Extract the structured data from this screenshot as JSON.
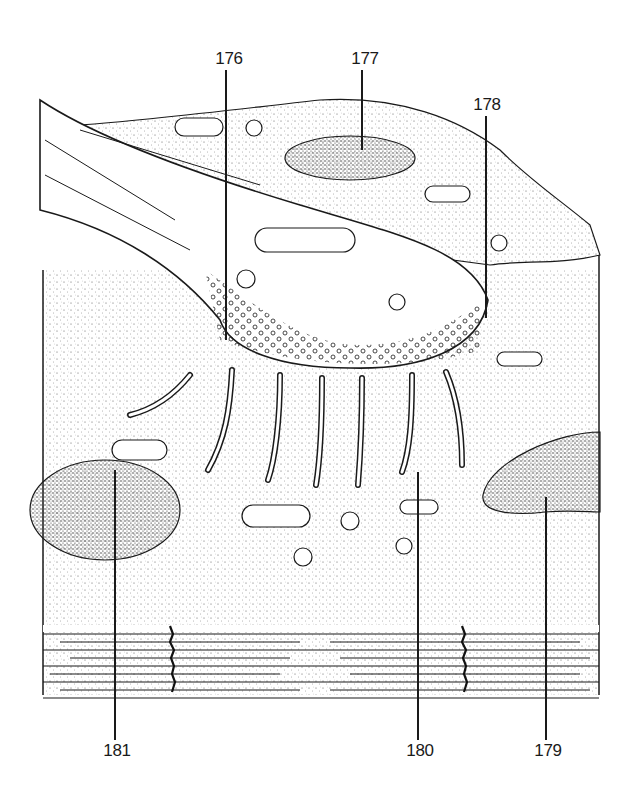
{
  "figure": {
    "type": "histology-line-drawing",
    "colors": {
      "ink": "#1a1a1a",
      "background": "#ffffff",
      "stipple": "#555555"
    }
  },
  "labels": [
    {
      "id": "176",
      "text": "176",
      "x": 229,
      "y": 66,
      "line_x": 226,
      "line_from": 70,
      "line_to": 340,
      "position": "top"
    },
    {
      "id": "177",
      "text": "177",
      "x": 365,
      "y": 66,
      "line_x": 362,
      "line_from": 70,
      "line_to": 150,
      "position": "top"
    },
    {
      "id": "178",
      "text": "178",
      "x": 487,
      "y": 112,
      "line_x": 486,
      "line_from": 116,
      "line_to": 318,
      "position": "top"
    },
    {
      "id": "179",
      "text": "179",
      "x": 548,
      "y": 758,
      "line_x": 546,
      "line_from": 497,
      "line_to": 740,
      "position": "bottom"
    },
    {
      "id": "180",
      "text": "180",
      "x": 420,
      "y": 758,
      "line_x": 418,
      "line_from": 472,
      "line_to": 740,
      "position": "bottom"
    },
    {
      "id": "181",
      "text": "181",
      "x": 117,
      "y": 758,
      "line_x": 115,
      "line_from": 470,
      "line_to": 740,
      "position": "bottom"
    }
  ]
}
